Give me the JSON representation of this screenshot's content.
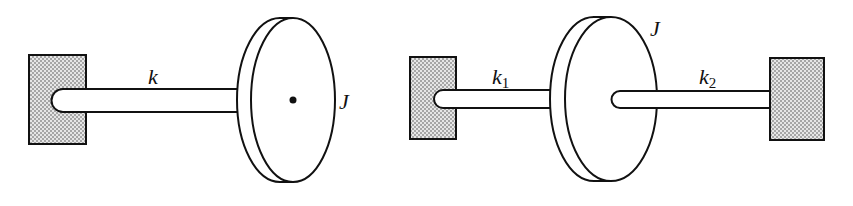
{
  "diagram": {
    "left_system": {
      "shaft_label": "k",
      "inertia_label": "J",
      "components": [
        "fixed-wall",
        "shaft",
        "disk"
      ]
    },
    "right_system": {
      "shaft1_label": "k",
      "shaft1_subscript": "1",
      "shaft2_label": "k",
      "shaft2_subscript": "2",
      "inertia_label": "J",
      "components": [
        "fixed-wall-left",
        "shaft-1",
        "disk",
        "shaft-2",
        "fixed-wall-right"
      ]
    },
    "colors": {
      "line": "#111111",
      "wall_fill": "#d8d8d8",
      "background": "#ffffff"
    }
  }
}
